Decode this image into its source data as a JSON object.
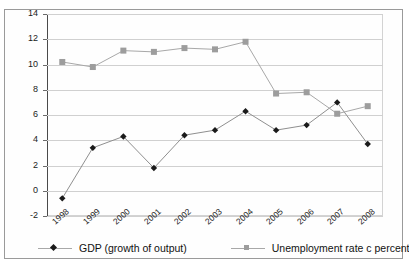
{
  "chart_data": {
    "type": "line",
    "title": "",
    "xlabel": "",
    "ylabel": "",
    "categories": [
      "1998",
      "1999",
      "2000",
      "2001",
      "2002",
      "2003",
      "2004",
      "2005",
      "2006",
      "2007",
      "2008"
    ],
    "series": [
      {
        "name": "GDP (growth of output)",
        "marker": "diamond",
        "color": "#1a1a1a",
        "line_color": "#8f8f8f",
        "values": [
          -0.6,
          3.4,
          4.3,
          1.8,
          4.4,
          4.8,
          6.3,
          4.8,
          5.2,
          7.0,
          3.7
        ]
      },
      {
        "name": "Unemployment rate c  percent",
        "marker": "square",
        "color": "#9d9d9d",
        "line_color": "#a8a8a8",
        "values": [
          10.2,
          9.8,
          11.1,
          11.0,
          11.3,
          11.2,
          11.8,
          7.7,
          7.8,
          6.1,
          6.7
        ]
      }
    ],
    "ylim": [
      -2,
      14
    ],
    "yticks": [
      -2,
      0,
      2,
      4,
      6,
      8,
      10,
      12,
      14
    ],
    "ytick_labels": [
      "-2",
      "0",
      "2",
      "4",
      "6",
      "8",
      "10",
      "12",
      "14"
    ],
    "grid": true,
    "legend_position": "bottom"
  },
  "legend": {
    "items": [
      {
        "label": "GDP (growth of output)",
        "marker": "diamond-marker",
        "color": "#1a1a1a"
      },
      {
        "label": "Unemployment rate c  percent",
        "marker": "square-marker",
        "color": "#9d9d9d"
      }
    ]
  }
}
